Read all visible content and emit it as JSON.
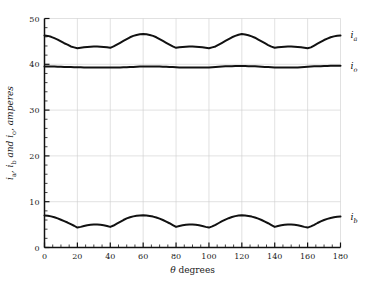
{
  "chart_data": {
    "type": "line",
    "title": "",
    "xlabel": "θ degrees",
    "ylabel": "iₐ, i_b and i_o, amperes",
    "ylabel_parts": {
      "pre": "i",
      "sub1": "a",
      "mid": ", i",
      "sub2": "b",
      "mid2": " and i",
      "sub3": "o",
      "tail": ", amperes"
    },
    "xlim": [
      0,
      180
    ],
    "ylim": [
      0,
      50
    ],
    "xticks": [
      0,
      20,
      40,
      60,
      80,
      100,
      120,
      140,
      160,
      180
    ],
    "yticks": [
      0,
      10,
      20,
      30,
      40,
      50
    ],
    "x_minor_step": 5,
    "y_minor_step": 2,
    "grid": true,
    "legend_position": "inline-right",
    "annotations": [
      {
        "name": "ia",
        "text": "i",
        "sub": "a",
        "x": 183,
        "y": 46.3
      },
      {
        "name": "io",
        "text": "i",
        "sub": "o",
        "x": 183,
        "y": 39.6
      },
      {
        "name": "ib",
        "text": "i",
        "sub": "b",
        "x": 183,
        "y": 6.6
      }
    ],
    "x": [
      0,
      2,
      4,
      6,
      8,
      10,
      12,
      14,
      16,
      18,
      20,
      22,
      24,
      26,
      28,
      30,
      32,
      34,
      36,
      38,
      40,
      42,
      44,
      46,
      48,
      50,
      52,
      54,
      56,
      58,
      60,
      62,
      64,
      66,
      68,
      70,
      72,
      74,
      76,
      78,
      80,
      82,
      84,
      86,
      88,
      90,
      92,
      94,
      96,
      98,
      100,
      102,
      104,
      106,
      108,
      110,
      112,
      114,
      116,
      118,
      120,
      122,
      124,
      126,
      128,
      130,
      132,
      134,
      136,
      138,
      140,
      142,
      144,
      146,
      148,
      150,
      152,
      154,
      156,
      158,
      160,
      162,
      164,
      166,
      168,
      170,
      172,
      174,
      176,
      178,
      180
    ],
    "series": [
      {
        "name": "i_a",
        "label": "ia",
        "values": [
          46.3,
          46.2,
          46.0,
          45.7,
          45.4,
          45.0,
          44.6,
          44.3,
          43.9,
          43.7,
          43.5,
          43.6,
          43.7,
          43.8,
          43.85,
          43.9,
          43.9,
          43.85,
          43.8,
          43.7,
          43.6,
          43.9,
          44.3,
          44.7,
          45.1,
          45.5,
          45.9,
          46.2,
          46.4,
          46.55,
          46.6,
          46.55,
          46.4,
          46.2,
          45.9,
          45.5,
          45.1,
          44.7,
          44.3,
          43.9,
          43.6,
          43.7,
          43.8,
          43.85,
          43.9,
          43.9,
          43.85,
          43.8,
          43.7,
          43.6,
          43.5,
          43.7,
          43.9,
          44.3,
          44.7,
          45.1,
          45.5,
          45.9,
          46.2,
          46.45,
          46.6,
          46.5,
          46.35,
          46.1,
          45.8,
          45.4,
          45.0,
          44.6,
          44.2,
          43.85,
          43.6,
          43.7,
          43.8,
          43.85,
          43.9,
          43.9,
          43.85,
          43.8,
          43.7,
          43.6,
          43.5,
          43.7,
          44.1,
          44.5,
          44.9,
          45.3,
          45.6,
          45.9,
          46.1,
          46.25,
          46.3
        ]
      },
      {
        "name": "i_o",
        "label": "io",
        "values": [
          39.5,
          39.5,
          39.5,
          39.5,
          39.45,
          39.45,
          39.4,
          39.4,
          39.4,
          39.35,
          39.35,
          39.35,
          39.3,
          39.3,
          39.3,
          39.3,
          39.3,
          39.3,
          39.3,
          39.3,
          39.3,
          39.3,
          39.3,
          39.3,
          39.35,
          39.35,
          39.4,
          39.4,
          39.45,
          39.5,
          39.5,
          39.5,
          39.5,
          39.5,
          39.5,
          39.5,
          39.45,
          39.45,
          39.4,
          39.4,
          39.35,
          39.3,
          39.3,
          39.3,
          39.3,
          39.3,
          39.3,
          39.3,
          39.3,
          39.3,
          39.3,
          39.35,
          39.4,
          39.45,
          39.5,
          39.55,
          39.6,
          39.6,
          39.65,
          39.65,
          39.65,
          39.65,
          39.6,
          39.6,
          39.55,
          39.5,
          39.45,
          39.4,
          39.4,
          39.35,
          39.3,
          39.3,
          39.3,
          39.3,
          39.3,
          39.3,
          39.3,
          39.3,
          39.35,
          39.4,
          39.45,
          39.5,
          39.55,
          39.6,
          39.6,
          39.65,
          39.65,
          39.7,
          39.7,
          39.7,
          39.7
        ]
      },
      {
        "name": "i_b",
        "label": "ib",
        "values": [
          7.0,
          6.95,
          6.8,
          6.6,
          6.35,
          6.05,
          5.75,
          5.45,
          5.1,
          4.75,
          4.35,
          4.5,
          4.7,
          4.85,
          4.95,
          5.0,
          5.0,
          4.95,
          4.85,
          4.7,
          4.5,
          4.8,
          5.2,
          5.6,
          6.0,
          6.35,
          6.6,
          6.8,
          6.95,
          7.0,
          7.05,
          7.0,
          6.9,
          6.75,
          6.55,
          6.3,
          6.0,
          5.65,
          5.3,
          4.9,
          4.5,
          4.7,
          4.85,
          4.95,
          5.0,
          5.0,
          4.95,
          4.85,
          4.7,
          4.5,
          4.35,
          4.6,
          4.95,
          5.35,
          5.75,
          6.1,
          6.4,
          6.65,
          6.85,
          6.98,
          7.05,
          7.0,
          6.9,
          6.75,
          6.55,
          6.3,
          6.0,
          5.65,
          5.3,
          4.9,
          4.5,
          4.7,
          4.85,
          4.95,
          5.0,
          5.0,
          4.95,
          4.85,
          4.7,
          4.5,
          4.35,
          4.6,
          4.95,
          5.35,
          5.7,
          6.0,
          6.25,
          6.45,
          6.6,
          6.7,
          6.75
        ]
      }
    ]
  }
}
